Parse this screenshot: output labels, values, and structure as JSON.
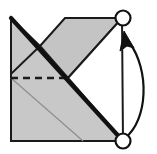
{
  "figure": {
    "name": "origami-fold-step-diagram",
    "width": 157,
    "height": 154,
    "background_color": "#ffffff"
  },
  "colors": {
    "paper_gray": "#c8c8c8",
    "paper_gray_shade": "#c4c4c4",
    "paper_white": "#ffffff",
    "outline": "#1a1a1a",
    "thin_crease": "#8c8c8c",
    "fold_edge": "#111111",
    "arrow": "#111111",
    "marker_stroke": "#111111",
    "marker_fill": "#ffffff"
  },
  "geometry": {
    "square_left": 11,
    "square_top": 18,
    "square_right": 123,
    "square_bottom": 141,
    "center_vertex_x": 68,
    "center_vertex_y": 78,
    "top_notch_x": 65,
    "top_notch_y": 18,
    "notch_apex_x": 40,
    "notch_apex_y": 46,
    "thin_crease_end_x": 83,
    "thin_crease_end_y": 141
  },
  "shapes": {
    "left_gray_triangle": {
      "label": "left-upper-gray-triangle",
      "points": "11,18 40,46 11,74"
    },
    "lower_left_gray_region": {
      "label": "lower-left-gray-body",
      "points": "11,18 68,78 123,141 11,141"
    },
    "upper_right_gray_parallelogram": {
      "label": "upper-right-gray-flap",
      "points": "40,46 65,18 122,18 68,78"
    },
    "right_white_triangle": {
      "label": "right-white-triangle",
      "points": "68,78 122,18 123,141"
    }
  },
  "lines": {
    "dashed_valley_crease": {
      "label": "dashed-valley-fold-crease",
      "x1": 11,
      "y1": 78,
      "x2": 68,
      "y2": 78,
      "dash_pattern": "7 5",
      "width": 2.4,
      "style": "dashed"
    },
    "thin_diagonal_crease": {
      "label": "thin-diagonal-crease",
      "x1": 11,
      "y1": 78,
      "x2": 83,
      "y2": 141,
      "width": 1.1,
      "style": "solid"
    },
    "thick_fold_diagonal": {
      "label": "thick-diagonal-fold-edge",
      "x1": 11,
      "y1": 18,
      "x2": 123,
      "y2": 141,
      "width": 4.2,
      "style": "solid"
    }
  },
  "markers": [
    {
      "name": "top-right-corner-marker",
      "label": "corner point marker (destination)",
      "cx": 123,
      "cy": 18,
      "r": 7.5,
      "stroke_width": 2.2
    },
    {
      "name": "bottom-right-corner-marker",
      "label": "corner point marker (origin)",
      "cx": 123,
      "cy": 141,
      "r": 7.5,
      "stroke_width": 2.2
    }
  ],
  "arrow": {
    "name": "fold-motion-arrow",
    "label": "curved fold motion arrow",
    "direction": "bottom-right corner moves up to top-right corner",
    "path": "M 125,138 C 148,120 150,70 129,42",
    "stroke_width": 2.2,
    "head_points": "124,31 134,48 127,46 120,51",
    "head_rotation_deg": 0
  }
}
